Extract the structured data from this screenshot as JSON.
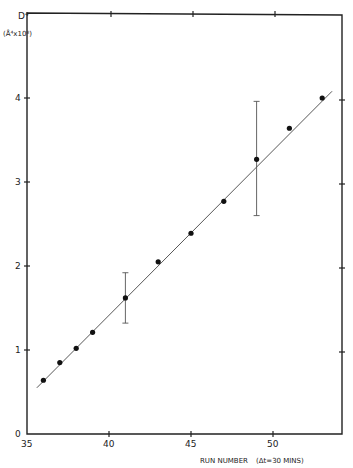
{
  "chart_data": {
    "type": "scatter",
    "title": "",
    "xlabel": "RUN NUMBER  (Δt = 30 MINS)",
    "ylabel": "D⁴ (Å⁴×10⁸)",
    "ylabel_line1": "D⁴",
    "ylabel_line2": "(Å⁴x10⁸)",
    "xlabel_text": "RUN NUMBER",
    "xlabel_note": "(Δt=30 MINS)",
    "xlim": [
      35,
      54.1
    ],
    "ylim": [
      0,
      4.95
    ],
    "x_ticks": [
      35,
      40,
      45,
      50
    ],
    "x_tick_labels": [
      "35",
      "40",
      "45",
      "50"
    ],
    "y_ticks": [
      0,
      1,
      2,
      3,
      4
    ],
    "y_tick_labels": [
      "0",
      "1",
      "2",
      "3",
      "4"
    ],
    "grid": false,
    "legend": null,
    "series": [
      {
        "name": "D^4 measurements",
        "x": [
          36,
          37,
          38,
          39,
          41,
          43,
          45,
          47,
          49,
          51,
          53
        ],
        "y": [
          0.64,
          0.85,
          1.02,
          1.21,
          1.62,
          2.05,
          2.39,
          2.77,
          3.27,
          3.64,
          4.0
        ]
      }
    ],
    "error_bars": [
      {
        "x": 41,
        "y": 1.62,
        "low": 1.32,
        "high": 1.92
      },
      {
        "x": 49,
        "y": 3.27,
        "low": 2.6,
        "high": 3.96
      }
    ],
    "fit_line": {
      "x": [
        35.6,
        53.6
      ],
      "y": [
        0.55,
        4.08
      ]
    }
  }
}
